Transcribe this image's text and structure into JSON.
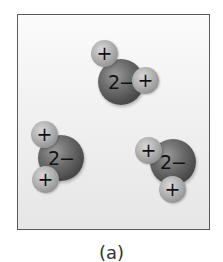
{
  "figure": {
    "caption": "(a)",
    "frame": {
      "border_color": "#5a5a5a",
      "background_top": "#fbfbfb",
      "background_bottom": "#e6e6e6"
    },
    "molecules": [
      {
        "name": "water-molecule-top",
        "oxygen_label": "2−",
        "hydrogens": [
          {
            "label": "+",
            "position": "upper-left"
          },
          {
            "label": "+",
            "position": "right"
          }
        ]
      },
      {
        "name": "water-molecule-left",
        "oxygen_label": "2−",
        "hydrogens": [
          {
            "label": "+",
            "position": "upper-left"
          },
          {
            "label": "+",
            "position": "lower-left"
          }
        ]
      },
      {
        "name": "water-molecule-right",
        "oxygen_label": "2−",
        "hydrogens": [
          {
            "label": "+",
            "position": "left"
          },
          {
            "label": "+",
            "position": "bottom"
          }
        ]
      }
    ]
  }
}
